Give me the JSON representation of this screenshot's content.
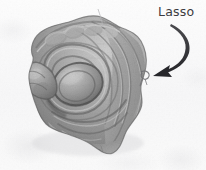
{
  "figure": {
    "type": "3d-surface-render-screenshot",
    "background_color": "#f8f8f9",
    "width": 206,
    "height": 170
  },
  "annotation": {
    "label": "Lasso",
    "label_color": "#3b3b3f",
    "arrow_color": "#2e2e32",
    "arrow_style": "curved-tapered-with-solid-head",
    "arrow_points_to": "lasso-marker-on-mesh-boundary"
  },
  "mesh": {
    "name": "grayscale-3d-mesh",
    "description": "shaded organic surface with concentric ridges, central rounded bulge, knobby left protrusion and jagged flared lower skirt",
    "shading": "grayscale-diffuse",
    "highlight_color": "#d8d8d8",
    "midtone_color": "#9d9d9d",
    "shadow_color": "#4a4a4a",
    "outline_color": "#3a3a3a"
  },
  "lasso_marker": {
    "name": "lasso-loop-marker",
    "color": "#6a6a6e",
    "position_hint": "right boundary of mesh"
  }
}
